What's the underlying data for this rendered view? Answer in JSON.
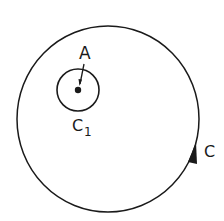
{
  "diagram": {
    "outer_contour": {
      "label": "C",
      "direction": "counterclockwise"
    },
    "inner_contour": {
      "label": "C",
      "subscript": "1"
    },
    "point": {
      "label": "A"
    }
  },
  "colors": {
    "stroke": "#1a1a1a",
    "background": "#ffffff"
  }
}
